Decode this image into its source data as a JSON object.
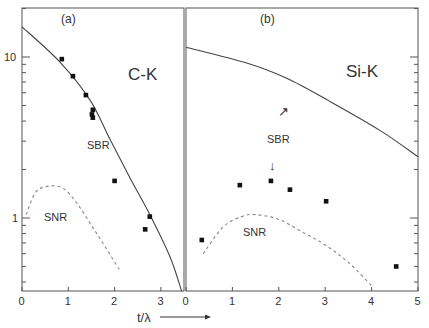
{
  "chart_data": [
    {
      "type": "scatter",
      "panel_label": "(a)",
      "title": "C-K",
      "xlabel": "t/λ",
      "ylabel": "",
      "xlim": [
        0,
        3.5
      ],
      "ylim": [
        0.35,
        20
      ],
      "yscale": "log",
      "x_ticks": [
        0,
        1,
        2,
        3
      ],
      "y_ticks": [
        1,
        10
      ],
      "grid": false,
      "series": [
        {
          "name": "SBR",
          "kind": "line-solid",
          "x": [
            0,
            0.82,
            1.47,
            1.9,
            2.33,
            2.76,
            3.2,
            3.45
          ],
          "y": [
            15.4,
            9.3,
            5.4,
            3.08,
            1.78,
            1.05,
            0.57,
            0.35
          ]
        },
        {
          "name": "SBR measured",
          "kind": "points",
          "x": [
            0.86,
            1.1,
            1.38,
            1.53,
            1.51,
            1.53,
            2.0,
            2.76,
            2.66
          ],
          "y": [
            9.7,
            7.6,
            5.8,
            4.7,
            4.4,
            4.2,
            1.7,
            1.02,
            0.85
          ]
        },
        {
          "name": "SNR",
          "kind": "line-dashed",
          "x": [
            0.09,
            0.3,
            0.6,
            0.9,
            1.2,
            1.5,
            1.8,
            2.1
          ],
          "y": [
            1.05,
            1.45,
            1.58,
            1.52,
            1.22,
            0.9,
            0.66,
            0.48
          ]
        }
      ],
      "annotations": [
        {
          "text": "SBR",
          "x": 1.55,
          "y": 2.5
        },
        {
          "text": "SNR",
          "x": 0.4,
          "y": 1.0
        }
      ]
    },
    {
      "type": "scatter",
      "panel_label": "(b)",
      "title": "Si-K",
      "xlabel": "t/λ",
      "ylabel": "",
      "xlim": [
        0,
        5
      ],
      "ylim": [
        0.35,
        20
      ],
      "yscale": "log",
      "x_ticks": [
        0,
        1,
        2,
        3,
        4,
        5
      ],
      "y_ticks": [
        1,
        10
      ],
      "grid": false,
      "series": [
        {
          "name": "SBR",
          "kind": "line-solid",
          "x": [
            0,
            1.29,
            2.16,
            3.1,
            4.18,
            5.0
          ],
          "y": [
            11.5,
            9.2,
            7.4,
            5.3,
            3.5,
            2.4
          ]
        },
        {
          "name": "SBR measured",
          "kind": "points",
          "x": [
            0.34,
            1.16,
            1.83,
            2.24,
            3.02,
            4.53
          ],
          "y": [
            0.73,
            1.6,
            1.7,
            1.5,
            1.27,
            0.5
          ]
        },
        {
          "name": "SNR",
          "kind": "line-dashed",
          "x": [
            0.37,
            0.8,
            1.2,
            1.5,
            2.0,
            2.5,
            3.0,
            3.5,
            4.0
          ],
          "y": [
            0.6,
            0.88,
            1.02,
            1.05,
            0.98,
            0.82,
            0.68,
            0.53,
            0.38
          ]
        }
      ],
      "annotations": [
        {
          "text": "SBR",
          "x": 2.0,
          "y": 3.4
        },
        {
          "text": "SNR",
          "x": 1.5,
          "y": 0.78
        },
        {
          "text": "↑",
          "x": 2.08,
          "y": 5.5
        },
        {
          "text": "↓",
          "x": 1.9,
          "y": 2.4
        }
      ]
    }
  ],
  "labels": {
    "panel_a": "(a)",
    "panel_b": "(b)",
    "element_a": "C-K",
    "element_b": "Si-K",
    "sbr": "SBR",
    "snr": "SNR",
    "x_axis": "t/λ",
    "y_tick_10": "10",
    "y_tick_1": "1",
    "arrow_up": "↗",
    "arrow_down": "↓"
  }
}
